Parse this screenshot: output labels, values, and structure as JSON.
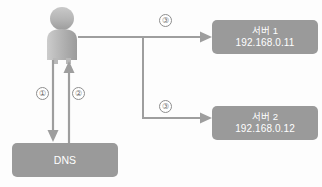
{
  "diagram": {
    "type": "dns-resolution-flow",
    "background_color": "#fdfdfd",
    "node_fill_color": "#9a9a9a",
    "node_text_color": "#ffffff",
    "connector_color": "#9e9e9e",
    "label_text_color": "#6f6f6f",
    "actor": {
      "name": "client-person-icon",
      "icon": "person-icon"
    },
    "nodes": [
      {
        "id": "server1",
        "title": "서버 1",
        "subtitle": "192.168.0.11"
      },
      {
        "id": "server2",
        "title": "서버 2",
        "subtitle": "192.168.0.12"
      },
      {
        "id": "dns",
        "title": "DNS",
        "subtitle": ""
      }
    ],
    "steps": [
      {
        "id": "step1",
        "label": "①",
        "from": "client",
        "to": "dns",
        "direction": "down"
      },
      {
        "id": "step2",
        "label": "②",
        "from": "dns",
        "to": "client",
        "direction": "up"
      },
      {
        "id": "step3a",
        "label": "③",
        "from": "client",
        "to": "server1",
        "direction": "right"
      },
      {
        "id": "step3b",
        "label": "③",
        "from": "client",
        "to": "server2",
        "direction": "right"
      }
    ]
  }
}
